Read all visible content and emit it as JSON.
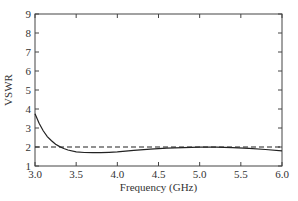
{
  "chart_data": {
    "type": "line",
    "title": "",
    "xlabel": "Frequency (GHz)",
    "ylabel": "VSWR",
    "xlim": [
      3.0,
      6.0
    ],
    "ylim": [
      1,
      9
    ],
    "x_ticks": [
      "3.0",
      "3.5",
      "4.0",
      "4.5",
      "5.0",
      "5.5",
      "6.0"
    ],
    "y_ticks": [
      "1",
      "2",
      "3",
      "4",
      "5",
      "6",
      "7",
      "8",
      "9"
    ],
    "grid": false,
    "legend": null,
    "series": [
      {
        "name": "VSWR",
        "style": "solid",
        "color": "#222222",
        "x": [
          3.0,
          3.05,
          3.1,
          3.15,
          3.2,
          3.25,
          3.3,
          3.35,
          3.4,
          3.5,
          3.6,
          3.7,
          3.8,
          3.9,
          4.0,
          4.2,
          4.4,
          4.6,
          4.8,
          5.0,
          5.2,
          5.4,
          5.6,
          5.8,
          6.0
        ],
        "values": [
          3.75,
          3.25,
          2.85,
          2.55,
          2.33,
          2.15,
          2.02,
          1.92,
          1.84,
          1.75,
          1.71,
          1.7,
          1.7,
          1.72,
          1.75,
          1.82,
          1.89,
          1.94,
          1.97,
          1.99,
          1.99,
          1.97,
          1.93,
          1.87,
          1.8
        ]
      },
      {
        "name": "VSWR = 2 reference",
        "style": "dashed",
        "color": "#222222",
        "x": [
          3.0,
          6.0
        ],
        "values": [
          2.0,
          2.0
        ]
      }
    ]
  }
}
